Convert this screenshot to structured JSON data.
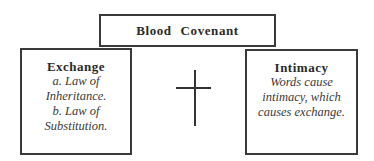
{
  "diagram": {
    "top_box": {
      "title": "Blood Covenant"
    },
    "left_box": {
      "title": "Exchange",
      "lines": [
        "a. Law of",
        "Inheritance.",
        "b. Law of",
        "Substitution."
      ]
    },
    "right_box": {
      "title": "Intimacy",
      "lines": [
        "Words cause",
        "intimacy, which",
        "causes exchange."
      ]
    },
    "center_symbol": "cross-icon"
  }
}
